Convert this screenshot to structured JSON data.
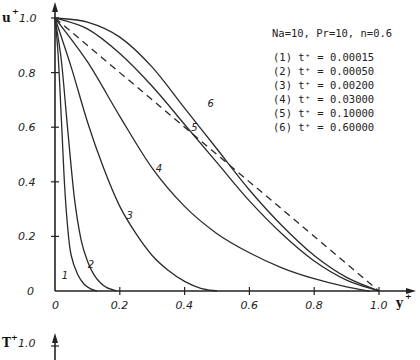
{
  "chart_data": {
    "type": "line",
    "title": "",
    "annotation": "Na=10, Pr=10, n=0.6",
    "xlabel": "y+",
    "ylabel": "u+",
    "xlim": [
      0,
      1.0
    ],
    "ylim": [
      0,
      1.0
    ],
    "grid": false,
    "legend_position": "upper right (text block)",
    "x_ticks": [
      "0",
      "0.2",
      "0.4",
      "0.6",
      "0.8",
      "1.0"
    ],
    "y_ticks": [
      "0",
      "0.2",
      "0.4",
      "0.6",
      "0.8",
      "1.0"
    ],
    "legend": [
      {
        "id": "(1)",
        "label": "t+ = 0.00015"
      },
      {
        "id": "(2)",
        "label": "t+ = 0.00050"
      },
      {
        "id": "(3)",
        "label": "t+ = 0.00200"
      },
      {
        "id": "(4)",
        "label": "t+ = 0.03000"
      },
      {
        "id": "(5)",
        "label": "t+ = 0.10000"
      },
      {
        "id": "(6)",
        "label": "t+ = 0.60000"
      }
    ],
    "series": [
      {
        "name": "1",
        "t_plus": 0.00015,
        "style": "solid",
        "x": [
          0,
          0.01,
          0.02,
          0.03,
          0.04,
          0.05,
          0.07,
          0.09,
          0.11,
          0.13
        ],
        "y": [
          1.0,
          0.86,
          0.62,
          0.38,
          0.22,
          0.13,
          0.06,
          0.025,
          0.008,
          0.0
        ]
      },
      {
        "name": "2",
        "t_plus": 0.0005,
        "style": "solid",
        "x": [
          0,
          0.02,
          0.04,
          0.06,
          0.08,
          0.1,
          0.12,
          0.14,
          0.16,
          0.19
        ],
        "y": [
          1.0,
          0.84,
          0.58,
          0.34,
          0.19,
          0.11,
          0.06,
          0.03,
          0.012,
          0.0
        ]
      },
      {
        "name": "3",
        "t_plus": 0.002,
        "style": "solid",
        "x": [
          0,
          0.05,
          0.1,
          0.15,
          0.2,
          0.25,
          0.3,
          0.35,
          0.4,
          0.45,
          0.5
        ],
        "y": [
          1.0,
          0.82,
          0.62,
          0.45,
          0.31,
          0.21,
          0.13,
          0.075,
          0.035,
          0.01,
          0.0
        ]
      },
      {
        "name": "4",
        "t_plus": 0.03,
        "style": "solid",
        "x": [
          0,
          0.1,
          0.2,
          0.3,
          0.4,
          0.5,
          0.6,
          0.7,
          0.8,
          0.9,
          0.97
        ],
        "y": [
          1.0,
          0.84,
          0.64,
          0.45,
          0.31,
          0.21,
          0.14,
          0.085,
          0.045,
          0.015,
          0.0
        ]
      },
      {
        "name": "5",
        "t_plus": 0.1,
        "style": "solid",
        "x": [
          0,
          0.1,
          0.2,
          0.3,
          0.4,
          0.5,
          0.6,
          0.7,
          0.8,
          0.9,
          1.0
        ],
        "y": [
          1.0,
          0.96,
          0.87,
          0.75,
          0.61,
          0.47,
          0.33,
          0.21,
          0.11,
          0.04,
          0.0
        ]
      },
      {
        "name": "6",
        "t_plus": 0.6,
        "style": "solid",
        "x": [
          0,
          0.1,
          0.2,
          0.3,
          0.4,
          0.5,
          0.6,
          0.7,
          0.8,
          0.9,
          1.0
        ],
        "y": [
          1.0,
          0.985,
          0.93,
          0.82,
          0.67,
          0.52,
          0.37,
          0.24,
          0.13,
          0.05,
          0.0
        ]
      },
      {
        "name": "linear reference",
        "style": "dashed",
        "x": [
          0,
          1.0
        ],
        "y": [
          1.0,
          0.0
        ]
      }
    ],
    "curve_labels": [
      {
        "text": "1",
        "x": 0.03,
        "y": 0.06
      },
      {
        "text": "2",
        "x": 0.11,
        "y": 0.1
      },
      {
        "text": "3",
        "x": 0.23,
        "y": 0.28
      },
      {
        "text": "4",
        "x": 0.32,
        "y": 0.45
      },
      {
        "text": "5",
        "x": 0.43,
        "y": 0.6
      },
      {
        "text": "6",
        "x": 0.48,
        "y": 0.69
      }
    ]
  },
  "lower_panel": {
    "ylabel": "T+",
    "y_top_tick": "1.0"
  }
}
